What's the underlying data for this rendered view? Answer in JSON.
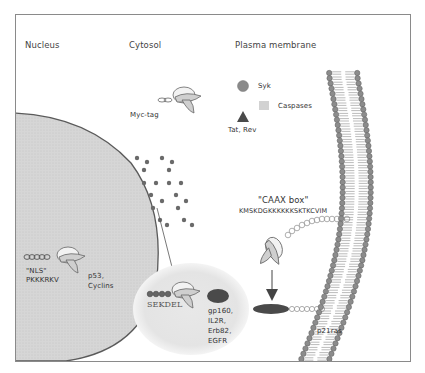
{
  "regions": {
    "nucleus": "Nucleus",
    "cytosol": "Cytosol",
    "plasma_membrane": "Plasma membrane"
  },
  "legend": {
    "syk": "Syk",
    "caspases": "Caspases",
    "tat_rev": "Tat, Rev"
  },
  "labels": {
    "myc_tag": "Myc-tag",
    "nls_title": "\"NLS\"",
    "nls_seq": "PKKKRKV",
    "nuclear_targets": [
      "p53,",
      "Cyclins"
    ],
    "er_signal": "SEKDEL",
    "er_targets": [
      "gp160,",
      "IL2R,",
      "Erb82,",
      "EGFR"
    ],
    "caax_title": "\"CAAX box\"",
    "caax_seq": "KMSKDGKKKKKKSKTKCVIM",
    "p21ras": "p21ras"
  },
  "icons": {
    "syk": "gray-circle-icon",
    "caspases": "light-square-icon",
    "tat_rev": "dark-triangle-icon",
    "antibody": "intrabody-fragment-icon",
    "membrane": "lipid-bilayer"
  },
  "colors": {
    "nucleus_fill": "#d4d4d4",
    "nucleus_stroke": "#5a5a5a",
    "er_fill": "#e6e6e6",
    "lipid_head": "#8c8c8c",
    "frame": "#8a8a8a",
    "dark_protein": "#4a4a4a"
  }
}
